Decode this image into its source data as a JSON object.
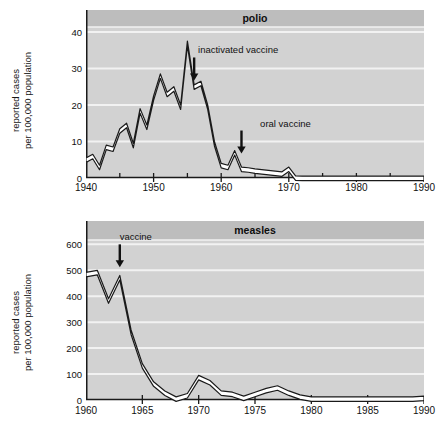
{
  "figure": {
    "background_color": "#ffffff",
    "plot_background_color": "#d2d2d2",
    "title_band_color": "#bdbdbd",
    "gridline_color": "#f2f2f2",
    "line_color": "#1a1a1a",
    "line_fill_color": "#ffffff",
    "axis_color": "#1a1a1a"
  },
  "panels": [
    {
      "key": "polio",
      "title": "polio",
      "ylabel_line1": "reported cases",
      "ylabel_line2": "per 100,000 population"
    },
    {
      "key": "measles",
      "title": "measles",
      "ylabel_line1": "reported cases",
      "ylabel_line2": "per 100,000 population"
    }
  ],
  "chart_data": [
    {
      "type": "line",
      "title": "polio",
      "xlabel": "",
      "ylabel": "reported cases per 100,000 population",
      "xlim": [
        1940,
        1990
      ],
      "ylim": [
        0,
        46
      ],
      "yticks": [
        0,
        10,
        20,
        30,
        40
      ],
      "ytick_labels": [
        "0",
        "10",
        "20",
        "30",
        "40"
      ],
      "xticks": [
        1940,
        1950,
        1960,
        1970,
        1980,
        1990
      ],
      "xtick_labels": [
        "1940",
        "1950",
        "1960",
        "1970",
        "1980",
        "1990"
      ],
      "xticks_minor": [
        1945,
        1955,
        1965,
        1975,
        1985
      ],
      "grid": "horizontal",
      "legend": "none",
      "annotations": [
        {
          "text": "inactivated vaccine",
          "x": 1956,
          "y": 33,
          "arrow": "down",
          "arrow_x": 1956
        },
        {
          "text": "oral vaccine",
          "x": 1963,
          "y": 13,
          "arrow": "down",
          "arrow_x": 1963
        }
      ],
      "series": [
        {
          "name": "polio reported cases",
          "x": [
            1940,
            1941,
            1942,
            1943,
            1944,
            1945,
            1946,
            1947,
            1948,
            1949,
            1950,
            1951,
            1952,
            1953,
            1954,
            1955,
            1956,
            1957,
            1958,
            1959,
            1960,
            1961,
            1962,
            1963,
            1964,
            1965,
            1966,
            1967,
            1968,
            1969,
            1970,
            1971,
            1972,
            1973,
            1974,
            1975,
            1976,
            1977,
            1978,
            1979,
            1980,
            1981,
            1982,
            1983,
            1984,
            1985,
            1986,
            1987,
            1988,
            1989,
            1990
          ],
          "y": [
            5.5,
            6.5,
            3.5,
            9.0,
            8.5,
            13.5,
            15.0,
            9.5,
            19.0,
            14.5,
            22.5,
            28.5,
            23.5,
            25.0,
            20.0,
            37.5,
            25.5,
            26.5,
            20.0,
            10.0,
            4.0,
            3.5,
            7.5,
            3.0,
            2.8,
            2.5,
            2.3,
            2.1,
            1.9,
            1.7,
            3.0,
            0.6,
            0.5,
            0.5,
            0.5,
            0.5,
            0.5,
            0.5,
            0.5,
            0.5,
            0.5,
            0.5,
            0.5,
            0.5,
            0.5,
            0.5,
            0.5,
            0.5,
            0.5,
            0.5,
            0.5
          ]
        }
      ]
    },
    {
      "type": "line",
      "title": "measles",
      "xlabel": "",
      "ylabel": "reported cases per 100,000 population",
      "xlim": [
        1960,
        1990
      ],
      "ylim": [
        0,
        690
      ],
      "yticks": [
        0,
        100,
        200,
        300,
        400,
        500,
        600
      ],
      "ytick_labels": [
        "0",
        "100",
        "200",
        "300",
        "400",
        "500",
        "600"
      ],
      "xticks": [
        1960,
        1965,
        1970,
        1975,
        1980,
        1985,
        1990
      ],
      "xtick_labels": [
        "1960",
        "1965",
        "1970",
        "1975",
        "1980",
        "1985",
        "1990"
      ],
      "grid": "horizontal",
      "legend": "none",
      "annotations": [
        {
          "text": "vaccine",
          "x": 1963,
          "y": 600,
          "arrow": "down",
          "arrow_x": 1963
        }
      ],
      "series": [
        {
          "name": "measles reported cases",
          "x": [
            1960,
            1961,
            1962,
            1963,
            1964,
            1965,
            1966,
            1967,
            1968,
            1969,
            1970,
            1971,
            1972,
            1973,
            1974,
            1975,
            1976,
            1977,
            1978,
            1979,
            1980,
            1981,
            1982,
            1983,
            1984,
            1985,
            1986,
            1987,
            1988,
            1989,
            1990
          ],
          "y": [
            492,
            500,
            390,
            480,
            270,
            140,
            70,
            35,
            12,
            25,
            95,
            75,
            35,
            30,
            15,
            30,
            45,
            55,
            35,
            20,
            12,
            12,
            12,
            12,
            12,
            12,
            12,
            12,
            12,
            12,
            15
          ]
        }
      ]
    }
  ]
}
